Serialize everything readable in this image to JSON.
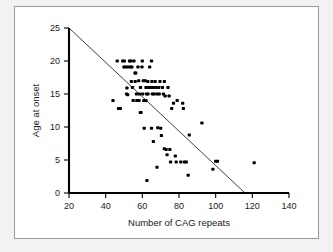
{
  "figure": {
    "type": "scatter-plot",
    "background_color": "#f2f2f2",
    "panel_color": "#ffffff",
    "border_color": "#9a9a9a",
    "point_color": "#000000",
    "line_color": "#2a2a2a"
  },
  "chart_data": {
    "type": "scatter",
    "title": "",
    "xlabel": "Number of CAG repeats",
    "ylabel": "Age at onset",
    "xlim": [
      20,
      140
    ],
    "ylim": [
      0,
      25
    ],
    "xticks": [
      20,
      40,
      60,
      80,
      100,
      120,
      140
    ],
    "yticks": [
      0,
      5,
      10,
      15,
      20,
      25
    ],
    "xtick_labels": [
      "20",
      "40",
      "60",
      "80",
      "100",
      "120",
      "140"
    ],
    "ytick_labels": [
      "0",
      "5",
      "10",
      "15",
      "20",
      "25"
    ],
    "grid": false,
    "legend": null,
    "legend_position": "none",
    "trendline": {
      "label": "fitted regression line",
      "x_start": 20,
      "y_start": 25,
      "x_end": 116,
      "y_end": 0
    },
    "points": [
      [
        44.0,
        14.0
      ],
      [
        46.3,
        20.0
      ],
      [
        47.0,
        12.8
      ],
      [
        48.0,
        12.8
      ],
      [
        49.3,
        20.0
      ],
      [
        50.2,
        20.0
      ],
      [
        50.0,
        19.1
      ],
      [
        51.0,
        19.1
      ],
      [
        51.6,
        15.9
      ],
      [
        51.4,
        15.0
      ],
      [
        52.0,
        14.9
      ],
      [
        52.2,
        19.1
      ],
      [
        53.0,
        20.0
      ],
      [
        53.8,
        20.0
      ],
      [
        53.5,
        19.1
      ],
      [
        54.3,
        19.1
      ],
      [
        54.0,
        16.9
      ],
      [
        54.6,
        16.0
      ],
      [
        55.0,
        14.0
      ],
      [
        55.4,
        20.0
      ],
      [
        56.0,
        18.2
      ],
      [
        56.4,
        18.2
      ],
      [
        56.1,
        16.9
      ],
      [
        56.8,
        15.0
      ],
      [
        57.0,
        14.0
      ],
      [
        57.6,
        19.1
      ],
      [
        58.0,
        17.0
      ],
      [
        58.4,
        15.0
      ],
      [
        58.2,
        14.0
      ],
      [
        58.9,
        12.2
      ],
      [
        59.3,
        12.2
      ],
      [
        59.0,
        16.0
      ],
      [
        59.8,
        19.1
      ],
      [
        60.0,
        20.0
      ],
      [
        60.5,
        17.0
      ],
      [
        60.2,
        15.0
      ],
      [
        60.8,
        14.0
      ],
      [
        61.0,
        9.8
      ],
      [
        61.6,
        17.0
      ],
      [
        62.0,
        16.0
      ],
      [
        62.3,
        15.0
      ],
      [
        62.0,
        14.0
      ],
      [
        62.5,
        1.9
      ],
      [
        63.0,
        16.9
      ],
      [
        63.4,
        16.0
      ],
      [
        63.1,
        15.0
      ],
      [
        64.0,
        19.1
      ],
      [
        64.6,
        16.0
      ],
      [
        65.0,
        20.0
      ],
      [
        65.2,
        16.9
      ],
      [
        65.5,
        15.0
      ],
      [
        65.0,
        9.8
      ],
      [
        66.0,
        16.0
      ],
      [
        66.4,
        15.0
      ],
      [
        66.0,
        7.8
      ],
      [
        67.0,
        16.9
      ],
      [
        67.5,
        16.0
      ],
      [
        68.0,
        15.0
      ],
      [
        68.4,
        9.9
      ],
      [
        68.0,
        3.9
      ],
      [
        69.0,
        16.0
      ],
      [
        69.6,
        16.9
      ],
      [
        69.2,
        15.0
      ],
      [
        70.0,
        9.8
      ],
      [
        70.4,
        8.7
      ],
      [
        71.0,
        16.0
      ],
      [
        71.5,
        15.0
      ],
      [
        72.0,
        16.9
      ],
      [
        72.4,
        14.7
      ],
      [
        72.0,
        6.7
      ],
      [
        73.0,
        6.6
      ],
      [
        73.5,
        5.8
      ],
      [
        74.0,
        16.0
      ],
      [
        74.6,
        14.7
      ],
      [
        75.0,
        6.6
      ],
      [
        75.4,
        4.7
      ],
      [
        76.0,
        12.8
      ],
      [
        77.0,
        13.6
      ],
      [
        78.0,
        5.6
      ],
      [
        78.5,
        4.7
      ],
      [
        79.0,
        14.0
      ],
      [
        81.0,
        4.7
      ],
      [
        82.0,
        13.6
      ],
      [
        82.4,
        12.8
      ],
      [
        83.0,
        4.7
      ],
      [
        84.0,
        4.7
      ],
      [
        85.0,
        2.7
      ],
      [
        85.6,
        8.8
      ],
      [
        92.5,
        10.6
      ],
      [
        98.5,
        3.6
      ],
      [
        100.0,
        4.8
      ],
      [
        101.0,
        4.8
      ],
      [
        121.0,
        4.6
      ]
    ]
  }
}
